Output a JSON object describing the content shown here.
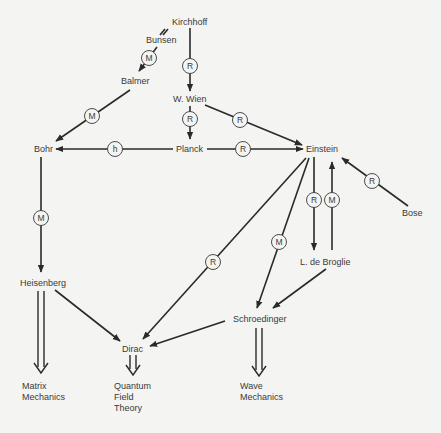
{
  "nodes": {
    "kirchhoff": "Kirchhoff",
    "bunsen": "Bunsen",
    "balmer": "Balmer",
    "wien": "W. Wien",
    "bohr": "Bohr",
    "planck": "Planck",
    "einstein": "Einstein",
    "bose": "Bose",
    "debroglie": "L. de Broglie",
    "heisenberg": "Heisenberg",
    "schroedinger": "Schroedinger",
    "dirac": "Dirac"
  },
  "outcomes": {
    "matrix": [
      "Matrix",
      "Mechanics"
    ],
    "qft": [
      "Quantum",
      "Field",
      "Theory"
    ],
    "wave": [
      "Wave",
      "Mechanics"
    ]
  },
  "edges": [
    {
      "from": "Bunsen",
      "to": "Balmer",
      "label": "M"
    },
    {
      "from": "Kirchhoff",
      "to": "W. Wien",
      "label": "R"
    },
    {
      "from": "Balmer",
      "to": "Bohr",
      "label": "M"
    },
    {
      "from": "W. Wien",
      "to": "Planck",
      "label": "R"
    },
    {
      "from": "W. Wien",
      "to": "Einstein",
      "label": "R"
    },
    {
      "from": "Planck",
      "to": "Bohr",
      "label": "h"
    },
    {
      "from": "Planck",
      "to": "Einstein",
      "label": "R"
    },
    {
      "from": "Bose",
      "to": "Einstein",
      "label": "R"
    },
    {
      "from": "Einstein",
      "to": "L. de Broglie",
      "label": "R"
    },
    {
      "from": "L. de Broglie",
      "to": "Einstein",
      "label": "M"
    },
    {
      "from": "Bohr",
      "to": "Heisenberg",
      "label": "M"
    },
    {
      "from": "Einstein",
      "to": "Dirac",
      "label": "R"
    },
    {
      "from": "Einstein",
      "to": "Schroedinger",
      "label": "M"
    },
    {
      "from": "L. de Broglie",
      "to": "Schroedinger",
      "label": ""
    },
    {
      "from": "Heisenberg",
      "to": "Dirac",
      "label": ""
    },
    {
      "from": "Schroedinger",
      "to": "Dirac",
      "label": ""
    }
  ],
  "badges": {
    "m": "M",
    "r": "R",
    "h": "h"
  }
}
